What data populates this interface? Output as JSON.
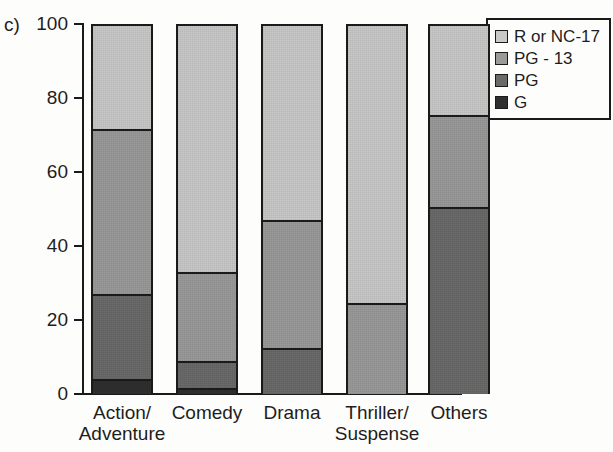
{
  "panel": {
    "label": "c)"
  },
  "chart_data": {
    "type": "bar",
    "subtype": "stacked-bar-100",
    "title": "",
    "xlabel": "",
    "ylabel": "",
    "ylim": [
      0,
      100
    ],
    "yticks": [
      0,
      20,
      40,
      60,
      80,
      100
    ],
    "ytick_labels": [
      "0",
      "20",
      "40",
      "60",
      "80",
      "100"
    ],
    "grid": false,
    "legend_position": "top-right",
    "categories": [
      "Action/\nAdventure",
      "Comedy",
      "Drama",
      "Thriller/\nSuspense",
      "Others"
    ],
    "category_lines": [
      [
        "Action/",
        "Adventure"
      ],
      [
        "Comedy"
      ],
      [
        "Drama"
      ],
      [
        "Thriller/",
        "Suspense"
      ],
      [
        "Others"
      ]
    ],
    "series": [
      {
        "name": "G",
        "color": "#2f2f2f",
        "values": [
          4.0,
          1.5,
          0.0,
          0.0,
          0.0
        ]
      },
      {
        "name": "PG",
        "color": "#6a6a6a",
        "values": [
          23.0,
          7.5,
          12.5,
          0.0,
          50.5
        ]
      },
      {
        "name": "PG - 13",
        "color": "#9a9a9a",
        "values": [
          44.5,
          24.0,
          34.5,
          24.5,
          25.0
        ]
      },
      {
        "name": "R or NC-17",
        "color": "#c9c9c9",
        "values": [
          28.5,
          67.0,
          53.0,
          75.5,
          24.5
        ]
      }
    ],
    "cumulative_tops": {
      "Action/Adventure": {
        "G": 4.0,
        "PG": 27.0,
        "PG - 13": 71.5,
        "R or NC-17": 100
      },
      "Comedy": {
        "G": 1.5,
        "PG": 9.0,
        "PG - 13": 33.0,
        "R or NC-17": 100
      },
      "Drama": {
        "G": 0.0,
        "PG": 12.5,
        "PG - 13": 47.0,
        "R or NC-17": 100
      },
      "Thriller/Suspense": {
        "G": 0.0,
        "PG": 0.0,
        "PG - 13": 24.5,
        "R or NC-17": 100
      },
      "Others": {
        "G": 0.0,
        "PG": 50.5,
        "PG - 13": 75.5,
        "R or NC-17": 100
      }
    }
  },
  "legend": {
    "entries": [
      {
        "label": "R or NC-17",
        "color": "#c9c9c9"
      },
      {
        "label": "PG - 13",
        "color": "#9a9a9a"
      },
      {
        "label": "PG",
        "color": "#6a6a6a"
      },
      {
        "label": "G",
        "color": "#2f2f2f"
      }
    ]
  }
}
